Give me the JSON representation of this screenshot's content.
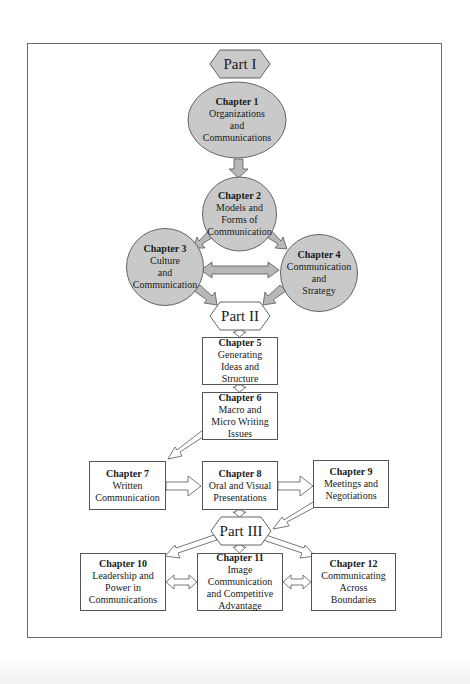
{
  "colors": {
    "circle_fill": "#c9c9c9",
    "hex_part1_fill": "#c9c9c9",
    "hex_fill": "#ffffff",
    "stroke": "#555555",
    "arrow_fill": "#b8b8b8"
  },
  "parts": [
    {
      "label": "Part I"
    },
    {
      "label": "Part II"
    },
    {
      "label": "Part III"
    }
  ],
  "chapters": [
    {
      "num": "Chapter 1",
      "title": "Organizations\nand\nCommunications",
      "shape": "circle"
    },
    {
      "num": "Chapter 2",
      "title": "Models and\nForms of\nCommunication",
      "shape": "circle"
    },
    {
      "num": "Chapter 3",
      "title": "Culture\nand\nCommunication",
      "shape": "circle"
    },
    {
      "num": "Chapter 4",
      "title": "Communication\nand\nStrategy",
      "shape": "circle"
    },
    {
      "num": "Chapter 5",
      "title": "Generating\nIdeas and\nStructure",
      "shape": "box"
    },
    {
      "num": "Chapter 6",
      "title": "Macro and\nMicro Writing\nIssues",
      "shape": "box"
    },
    {
      "num": "Chapter 7",
      "title": "Written\nCommunication",
      "shape": "box"
    },
    {
      "num": "Chapter 8",
      "title": "Oral and Visual\nPresentations",
      "shape": "box"
    },
    {
      "num": "Chapter 9",
      "title": "Meetings and\nNegotiations",
      "shape": "box"
    },
    {
      "num": "Chapter 10",
      "title": "Leadership and\nPower in\nCommunications",
      "shape": "box"
    },
    {
      "num": "Chapter 11",
      "title": "Image Communication\nand Competitive\nAdvantage",
      "shape": "box"
    },
    {
      "num": "Chapter 12",
      "title": "Communicating\nAcross\nBoundaries",
      "shape": "box"
    }
  ]
}
